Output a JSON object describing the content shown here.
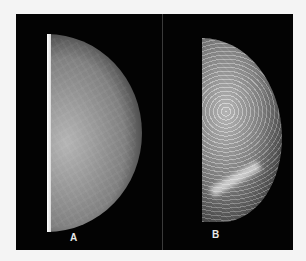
{
  "figure": {
    "panels": [
      {
        "label": "A",
        "description": "mammogram, low-contrast homogeneous breast tissue"
      },
      {
        "label": "B",
        "description": "mammogram, high-contrast dense fibroglandular breast tissue"
      }
    ]
  },
  "colors": {
    "background": "#f4f4f4",
    "frame": "#050505",
    "label": "#e8e8e8"
  }
}
